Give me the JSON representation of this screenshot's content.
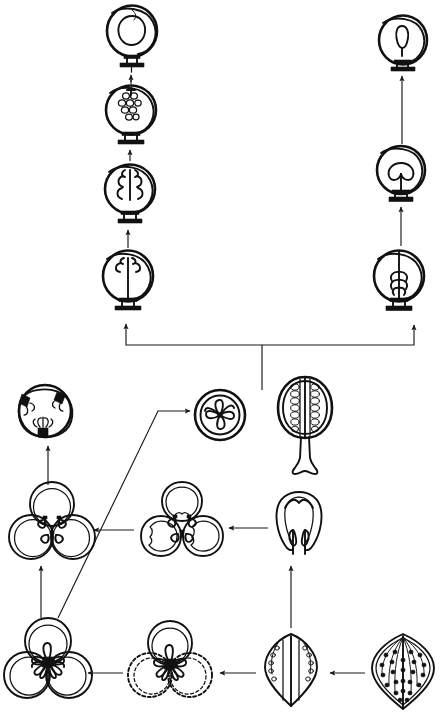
{
  "figure": {
    "kind": "botanical-line-diagram",
    "title_text": "",
    "background_color": "#ffffff",
    "ink_color": "#111111",
    "arrow_color": "#1a1a1a",
    "width": 441,
    "height": 722,
    "labels_present": false,
    "caption": ""
  },
  "nodes": [
    {
      "id": "ovule-left-1",
      "name": "ovule-with-single-embryo-sac",
      "group": "left-ovule-series",
      "stage_index": 4,
      "cx": 132,
      "cy": 31,
      "rx": 25,
      "ry": 26,
      "description": "Mature ovule: outer integument ring, inner teardrop-shaped embryo sac, short funiculus with basal foot",
      "inner_motif": "teardrop",
      "has_funiculus": true,
      "outline_style": "solid"
    },
    {
      "id": "ovule-left-2",
      "name": "ovule-with-cellular-megagametophyte",
      "group": "left-ovule-series",
      "stage_index": 3,
      "cx": 131,
      "cy": 110,
      "rx": 25,
      "ry": 25,
      "description": "Ovule containing a compact multicellular body (beaded cell rows) near the apex",
      "inner_motif": "cell-cluster-small",
      "has_funiculus": true,
      "outline_style": "solid"
    },
    {
      "id": "ovule-left-3",
      "name": "ovule-with-enlarged-cell-mass",
      "group": "left-ovule-series",
      "stage_index": 2,
      "cx": 130,
      "cy": 189,
      "rx": 25,
      "ry": 25,
      "description": "Ovule with a larger lobed multicellular mass occupying the upper half",
      "inner_motif": "cell-cluster-large",
      "has_funiculus": true,
      "outline_style": "solid"
    },
    {
      "id": "ovule-left-4",
      "name": "ovule-with-central-axis-and-crown",
      "group": "left-ovule-series",
      "stage_index": 1,
      "cx": 128,
      "cy": 276,
      "rx": 25,
      "ry": 26,
      "description": "Ovule traversed by a long central axis ending in a small crown of lobes at the top",
      "inner_motif": "axis-with-crown",
      "has_funiculus": true,
      "outline_style": "solid"
    },
    {
      "id": "ovule-right-1",
      "name": "ovule-with-small-embryo",
      "group": "right-ovule-series",
      "stage_index": 4,
      "cx": 403,
      "cy": 40,
      "rx": 24,
      "ry": 25,
      "description": "Ovule with a small narrow embryo suspended centrally",
      "inner_motif": "narrow-embryo",
      "has_funiculus": true,
      "outline_style": "solid"
    },
    {
      "id": "ovule-right-2",
      "name": "ovule-with-two-cotyledon-embryo",
      "group": "right-ovule-series",
      "stage_index": 3,
      "cx": 401,
      "cy": 170,
      "rx": 24,
      "ry": 24,
      "description": "Ovule with a two-lobed (cotyledonary) embryo on a short stalk",
      "inner_motif": "two-lobed-embryo",
      "has_funiculus": true,
      "outline_style": "solid"
    },
    {
      "id": "ovule-right-3",
      "name": "ovule-with-axial-pinnate-structure",
      "group": "right-ovule-series",
      "stage_index": 1,
      "cx": 399,
      "cy": 276,
      "rx": 25,
      "ry": 26,
      "description": "Ovule with a long central axis bearing pinnate lateral appendages along its lower half",
      "inner_motif": "axis-with-pinnae",
      "has_funiculus": true,
      "outline_style": "solid"
    },
    {
      "id": "cross-section-three-placentae",
      "name": "ovary-cross-section-with-three-placentae",
      "group": "lower-left-series",
      "stage_index": 4,
      "cx": 45,
      "cy": 411,
      "rx": 26,
      "ry": 26,
      "description": "Transverse section of a unilocular ovary: double wall ring with three dark parietal placentae bearing ovules",
      "inner_motif": "three-dark-placentae",
      "outline_style": "solid"
    },
    {
      "id": "cross-section-central-placenta",
      "name": "ovary-cross-section-with-free-central-placenta",
      "group": "derived-section",
      "stage_index": 0,
      "cx": 220,
      "cy": 415,
      "rx": 26,
      "ry": 26,
      "description": "Transverse section of an ovary with a small free-central placenta bearing radiating ovules",
      "inner_motif": "free-central-rosette",
      "outline_style": "solid"
    },
    {
      "id": "fruit-longitudinal-section",
      "name": "fruit-longitudinal-section-with-stalk",
      "group": "standalone",
      "stage_index": 0,
      "cx": 305,
      "cy": 410,
      "rx": 26,
      "ry": 32,
      "description": "Longitudinal section of a stalked fruit showing two vertical rows of ovules flanking a central septum, set on a long grooved pedicel",
      "inner_motif": "paired-ovule-rows",
      "outline_style": "solid"
    },
    {
      "id": "trefoil-left-upper",
      "name": "tricarpellate-gynoecium-fused",
      "group": "lower-left-series",
      "stage_index": 3,
      "cx": 52,
      "cy": 525,
      "r_lobe": 22,
      "description": "Three fully fused carpels in transverse view; small paired ovules at each carpel junction",
      "inner_motif": "three-junction-ovule-pairs",
      "outline_style": "solid"
    },
    {
      "id": "trefoil-middle-upper",
      "name": "tricarpellate-gynoecium-partly-fused",
      "group": "lower-middle-series",
      "stage_index": 2,
      "cx": 182,
      "cy": 525,
      "r_lobe": 22,
      "description": "Three carpels in transverse view with wavy inner margins, partly fused, ovule pairs at the junctions",
      "inner_motif": "three-junction-ovule-pairs",
      "outline_style": "solid"
    },
    {
      "id": "single-carpel-open",
      "name": "single-open-carpel-with-two-ovules",
      "group": "lower-right-series",
      "stage_index": 1,
      "cx": 299,
      "cy": 525,
      "description": "One conduplicate carpel seen in transverse view, margins not fused, with two pendent marginal ovules",
      "inner_motif": "two-marginal-ovules",
      "outline_style": "solid"
    },
    {
      "id": "trefoil-bottom-left",
      "name": "tricarpellate-gynoecium-with-crowded-ovules",
      "group": "lower-left-series",
      "stage_index": 2,
      "cx": 52,
      "cy": 660,
      "r_lobe": 23,
      "description": "Three carpels in transverse view with a dense central cluster of ovules on the fused margins",
      "inner_motif": "dense-central-ovule-cluster",
      "outline_style": "solid"
    },
    {
      "id": "trefoil-bottom-middle",
      "name": "tricarpellate-gynoecium-two-carpels-reduced",
      "group": "lower-middle-series",
      "stage_index": 1,
      "cx": 170,
      "cy": 662,
      "r_lobe": 23,
      "description": "Three carpels in transverse view; the two lower carpels drawn with dashed outlines indicating reduction or loss",
      "inner_motif": "dense-central-ovule-cluster",
      "outline_style": "two-lobes-dashed"
    },
    {
      "id": "leaf-carpel-marginal-ovules",
      "name": "folded-leaf-carpel-with-marginal-ovules",
      "group": "lower-right-series",
      "stage_index": 1,
      "cx": 291,
      "cy": 668,
      "description": "Laminar carpel folded along the midrib, bearing a submarginal arc of ovules on each half",
      "inner_motif": "submarginal-ovule-arc",
      "outline_style": "solid"
    },
    {
      "id": "leaf-laminar-ovules",
      "name": "laminar-fertile-leaf-with-scattered-ovules",
      "group": "lower-right-series",
      "stage_index": 0,
      "cx": 403,
      "cy": 668,
      "description": "Primitive laminar fertile leaf with ovules scattered in rows over the blade surface and radiating veins",
      "inner_motif": "scattered-ovule-rows",
      "outline_style": "solid"
    }
  ],
  "connectors": [
    {
      "id": "c1",
      "name": "arrow-left-series-stage1-to-stage2",
      "from": "ovule-left-4",
      "to": "ovule-left-3",
      "direction": "up",
      "style": "solid"
    },
    {
      "id": "c2",
      "name": "arrow-left-series-stage2-to-stage3",
      "from": "ovule-left-3",
      "to": "ovule-left-2",
      "direction": "up",
      "style": "solid"
    },
    {
      "id": "c3",
      "name": "arrow-left-series-stage3-to-stage4",
      "from": "ovule-left-2",
      "to": "ovule-left-1",
      "direction": "up",
      "style": "solid"
    },
    {
      "id": "c4",
      "name": "arrow-right-series-stage1-to-stage2",
      "from": "ovule-right-3",
      "to": "ovule-right-2",
      "direction": "up",
      "style": "solid"
    },
    {
      "id": "c5",
      "name": "arrow-right-series-stage2-to-stage3",
      "from": "ovule-right-2",
      "to": "ovule-right-1",
      "direction": "up",
      "style": "solid"
    },
    {
      "id": "c6",
      "name": "bracket-split-to-two-ovule-series",
      "from": "fruit-longitudinal-section",
      "to": "ovule-left-4, ovule-right-3",
      "direction": "up-split",
      "style": "solid-bracket"
    },
    {
      "id": "c7",
      "name": "arrow-trefoil-to-cross-section",
      "from": "trefoil-left-upper",
      "to": "cross-section-three-placentae",
      "direction": "up",
      "style": "solid"
    },
    {
      "id": "c8",
      "name": "arrow-bottom-trefoil-to-trefoil",
      "from": "trefoil-bottom-left",
      "to": "trefoil-left-upper",
      "direction": "up",
      "style": "solid"
    },
    {
      "id": "c9",
      "name": "arrow-bottom-trefoil-to-central-placenta-section",
      "from": "trefoil-bottom-left",
      "to": "cross-section-central-placenta",
      "direction": "diagonal-up-right",
      "style": "solid-long"
    },
    {
      "id": "c10",
      "name": "arrow-middle-trefoil-to-left-trefoil",
      "from": "trefoil-middle-upper",
      "to": "trefoil-left-upper",
      "direction": "left",
      "style": "solid"
    },
    {
      "id": "c11",
      "name": "arrow-single-carpel-to-middle-trefoil",
      "from": "single-carpel-open",
      "to": "trefoil-middle-upper",
      "direction": "left",
      "style": "solid"
    },
    {
      "id": "c12",
      "name": "arrow-folded-leaf-to-single-carpel",
      "from": "leaf-carpel-marginal-ovules",
      "to": "single-carpel-open",
      "direction": "up",
      "style": "solid"
    },
    {
      "id": "c13",
      "name": "arrow-laminar-leaf-to-folded-leaf",
      "from": "leaf-laminar-ovules",
      "to": "leaf-carpel-marginal-ovules",
      "direction": "left",
      "style": "solid"
    },
    {
      "id": "c14",
      "name": "arrow-folded-leaf-to-bottom-trefoil-middle",
      "from": "leaf-carpel-marginal-ovules",
      "to": "trefoil-bottom-middle",
      "direction": "left",
      "style": "solid"
    },
    {
      "id": "c15",
      "name": "arrow-bottom-trefoil-middle-to-bottom-trefoil-left",
      "from": "trefoil-bottom-middle",
      "to": "trefoil-bottom-left",
      "direction": "left",
      "style": "solid"
    }
  ]
}
